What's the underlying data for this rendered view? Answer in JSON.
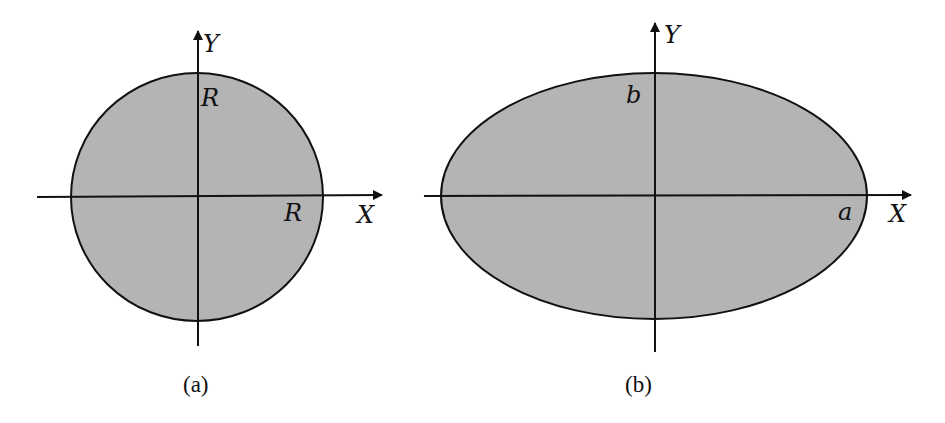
{
  "colors": {
    "fill": "#b4b4b4",
    "stroke": "#111111",
    "background": "#ffffff"
  },
  "figures": [
    {
      "id": "a",
      "shape": "circle",
      "caption": "(a)",
      "x_axis_label": "X",
      "y_axis_label": "Y",
      "radius_label_x": "R",
      "radius_label_y": "R"
    },
    {
      "id": "b",
      "shape": "ellipse",
      "caption": "(b)",
      "x_axis_label": "X",
      "y_axis_label": "Y",
      "semi_major_label": "a",
      "semi_minor_label": "b"
    }
  ]
}
